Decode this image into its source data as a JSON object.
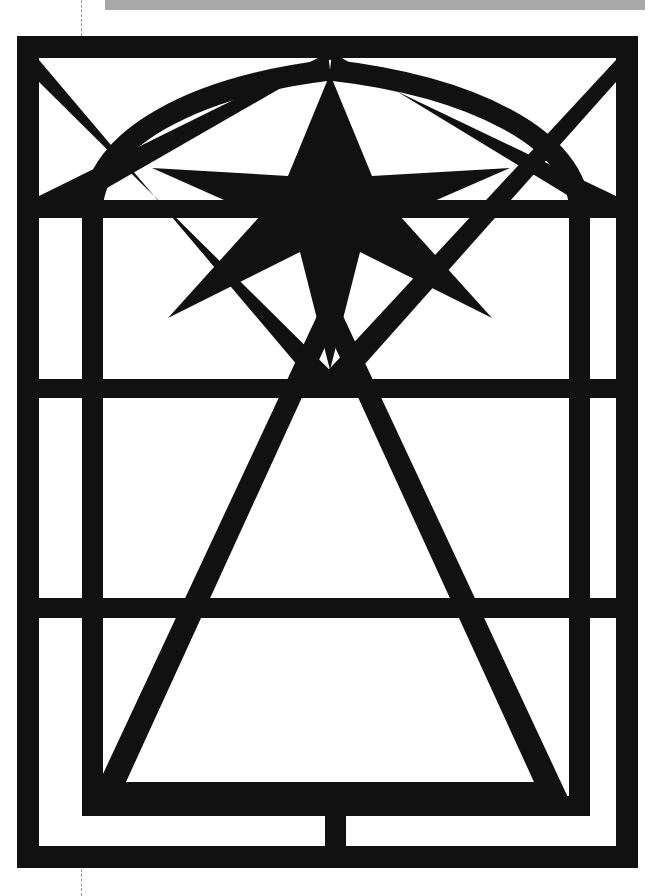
{
  "canvas": {
    "width": 656,
    "height": 896,
    "background_color": "#ffffff",
    "ink_color": "#111111",
    "accent_gray": "#a8a8a8",
    "guide_color": "#9a9a9a"
  },
  "top_bar": {
    "name": "scan-edge-gray-strip",
    "color": "#a8a8a8",
    "x": 105,
    "y": 0,
    "width": 540,
    "height": 10
  },
  "guides": [
    {
      "name": "crop-guide-top",
      "x": 81,
      "y": 0,
      "length": 36,
      "style": "dashed"
    },
    {
      "name": "crop-guide-bottom",
      "x": 81,
      "y": 869,
      "length": 27,
      "style": "dashed"
    }
  ],
  "artwork": {
    "title": "Stained Glass Window Cartoon",
    "description": "High-contrast black line drawing of an arched-panel window containing a six-pointed star above a large triangle, framed by a rectangular leaded grid.",
    "stroke_color": "#111111",
    "fill_color": "#ffffff",
    "frame": {
      "name": "outer-frame",
      "left": 17,
      "top": 36,
      "right": 638,
      "bottom": 868,
      "border_thickness": 22
    },
    "mullions": {
      "vertical": [
        {
          "name": "left-mullion",
          "x1": 82,
          "x2": 103,
          "y1": 200,
          "y2": 815
        },
        {
          "name": "right-mullion",
          "x1": 569,
          "x2": 590,
          "y1": 200,
          "y2": 815
        },
        {
          "name": "bottom-center-mullion",
          "x1": 325,
          "x2": 346,
          "y1": 815,
          "y2": 868
        }
      ],
      "horizontal": [
        {
          "name": "transom-upper",
          "y1": 200,
          "y2": 218,
          "x1": 17,
          "x2": 638
        },
        {
          "name": "transom-middle",
          "y1": 379,
          "y2": 398,
          "x1": 17,
          "x2": 638
        },
        {
          "name": "transom-lower",
          "y1": 598,
          "y2": 618,
          "x1": 17,
          "x2": 638
        },
        {
          "name": "transom-sill",
          "y1": 796,
          "y2": 816,
          "x1": 82,
          "x2": 590
        }
      ]
    },
    "star": {
      "name": "six-pointed-star",
      "center_x": 330,
      "center_y": 205,
      "points": 6,
      "top_tip_y": 74,
      "bottom_tip_y": 370,
      "left_tip_x": 152,
      "right_tip_x": 510
    },
    "triangle": {
      "name": "central-triangle",
      "apex_x": 330,
      "apex_y": 290,
      "base_left_x": 105,
      "base_right_x": 565,
      "base_y": 800,
      "stroke_width": 20
    },
    "diagonals": {
      "name": "upper-diagonal-rays",
      "count": 4,
      "origin_x": 330,
      "origin_y": 56,
      "description": "Two chevron rays fan from the top center to the left and right frame corners, crossing a second pair that fans downward to the middle transom."
    },
    "arcs": [
      {
        "name": "left-arch-curve",
        "from_x": 82,
        "from_y": 212,
        "to_x": 330,
        "to_y": 60
      },
      {
        "name": "right-arch-curve",
        "from_x": 590,
        "from_y": 212,
        "to_x": 330,
        "to_y": 60
      }
    ]
  },
  "labels": {
    "figure_caption": "Stained Glass Window Cartoon"
  }
}
